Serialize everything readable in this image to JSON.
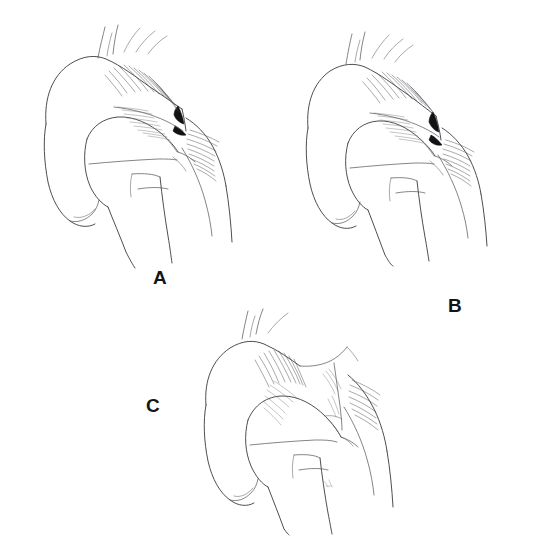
{
  "figure": {
    "kind": "medical-line-illustration",
    "background_color": "#ffffff",
    "ink_color": "#3a3a3e",
    "accent_color": "#121214",
    "panel_count": 3,
    "caption": ""
  },
  "panels": [
    {
      "id": "a",
      "label": "A",
      "label_position": {
        "x": 153,
        "y": 268
      },
      "grade": "Type I — acromioclavicular ligament sprain, joint reduced",
      "description": "Clavicle and acromion remain congruent; dense cross-hatch shading over the distal clavicle and a dark wedge marking the narrowed acromioclavicular joint line.",
      "structures": [
        "distal clavicle",
        "acromioclavicular joint",
        "acromion",
        "coracoid process",
        "humeral head",
        "greater tuberosity",
        "humeral shaft",
        "deltoid contour",
        "scapular spine",
        "trapezius slips"
      ]
    },
    {
      "id": "b",
      "label": "B",
      "label_position": {
        "x": 448,
        "y": 296
      },
      "grade": "Type II — acromioclavicular capsule disrupted, partial subluxation",
      "description": "Distal clavicle rides slightly above the acromion; joint interval widened with heavier ink at the disrupted capsule.",
      "structures": [
        "distal clavicle",
        "acromioclavicular joint",
        "acromion",
        "coracoid process",
        "humeral head",
        "greater tuberosity",
        "humeral shaft",
        "deltoid contour",
        "scapular spine",
        "trapezius slips"
      ]
    },
    {
      "id": "c",
      "label": "C",
      "label_position": {
        "x": 146,
        "y": 396
      },
      "grade": "Type III — coracoclavicular ligaments torn, complete dislocation",
      "description": "Clavicle clearly elevated and separated from the acromion, leaving a wide open gap spanned by the stretched coracoclavicular interval; the shoulder complex droops inferiorly.",
      "structures": [
        "distal clavicle",
        "separated acromioclavicular joint",
        "acromion",
        "coracoid process",
        "coracoclavicular interval",
        "humeral head",
        "greater tuberosity",
        "humeral shaft",
        "deltoid contour",
        "scapular spine",
        "artist signature mark"
      ]
    }
  ],
  "labels": {
    "a": "A",
    "b": "B",
    "c": "C"
  }
}
